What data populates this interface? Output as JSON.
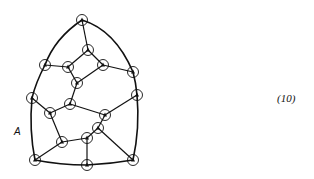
{
  "figure": {
    "label_A": "A",
    "equation_number": "(10)",
    "colors": {
      "stroke": "#111111",
      "background": "#ffffff"
    },
    "nodes": [
      {
        "id": "n0",
        "x": 82,
        "y": 20
      },
      {
        "id": "n1",
        "x": 88,
        "y": 50
      },
      {
        "id": "n2",
        "x": 45,
        "y": 65
      },
      {
        "id": "n3",
        "x": 68,
        "y": 67
      },
      {
        "id": "n4",
        "x": 103,
        "y": 65
      },
      {
        "id": "n5",
        "x": 133,
        "y": 72
      },
      {
        "id": "n6",
        "x": 77,
        "y": 83
      },
      {
        "id": "n7",
        "x": 32,
        "y": 98
      },
      {
        "id": "n8",
        "x": 137,
        "y": 95
      },
      {
        "id": "n9",
        "x": 70,
        "y": 104
      },
      {
        "id": "n10",
        "x": 50,
        "y": 113
      },
      {
        "id": "n11",
        "x": 105,
        "y": 115
      },
      {
        "id": "n12",
        "x": 98,
        "y": 128
      },
      {
        "id": "n13",
        "x": 87,
        "y": 138
      },
      {
        "id": "n14",
        "x": 62,
        "y": 142
      },
      {
        "id": "n15",
        "x": 35,
        "y": 160
      },
      {
        "id": "n16",
        "x": 87,
        "y": 165
      },
      {
        "id": "n17",
        "x": 133,
        "y": 160
      }
    ],
    "edges": [
      [
        "n0",
        "n1"
      ],
      [
        "n1",
        "n3"
      ],
      [
        "n1",
        "n4"
      ],
      [
        "n2",
        "n3"
      ],
      [
        "n3",
        "n6"
      ],
      [
        "n4",
        "n6"
      ],
      [
        "n4",
        "n5"
      ],
      [
        "n6",
        "n9"
      ],
      [
        "n9",
        "n10"
      ],
      [
        "n9",
        "n11"
      ],
      [
        "n11",
        "n8"
      ],
      [
        "n11",
        "n12"
      ],
      [
        "n12",
        "n13"
      ],
      [
        "n12",
        "n17"
      ],
      [
        "n13",
        "n14"
      ],
      [
        "n13",
        "n16"
      ],
      [
        "n14",
        "n10"
      ],
      [
        "n14",
        "n15"
      ],
      [
        "n7",
        "n10"
      ]
    ],
    "boundary_path": "M82,20 Q55,38 45,65 Q36,82 32,98 Q29,130 35,160 Q60,165 87,165 Q110,164 133,160 Q140,128 137,95 Q136,83 133,72 Q115,30 82,20"
  }
}
